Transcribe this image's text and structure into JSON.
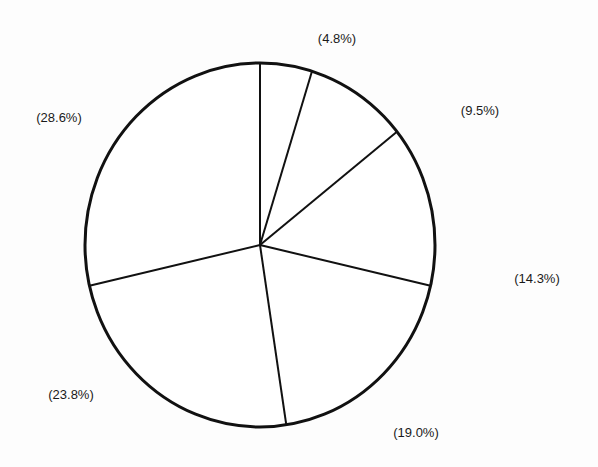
{
  "chart_data": {
    "type": "pie",
    "title": "",
    "start_angle_deg": 90,
    "direction": "clockwise",
    "labels": [
      "(4.8%)",
      "(9.5%)",
      "(14.3%)",
      "(19.0%)",
      "(23.8%)",
      "(28.6%)"
    ],
    "values": [
      4.8,
      9.5,
      14.3,
      19.0,
      23.8,
      28.6
    ],
    "fill_color": "#ffffff",
    "stroke_color": "#111111",
    "legend": "none"
  },
  "layout": {
    "center": [
      260,
      245
    ],
    "rx": 175,
    "ry": 182,
    "label_positions": [
      [
        337,
        38
      ],
      [
        480,
        110
      ],
      [
        537,
        278
      ],
      [
        416,
        432
      ],
      [
        71,
        394
      ],
      [
        59,
        117
      ]
    ]
  }
}
